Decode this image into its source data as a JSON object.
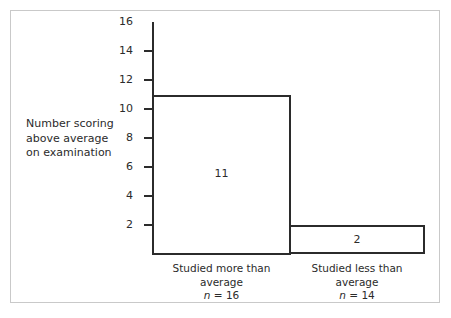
{
  "chart_data": {
    "type": "bar",
    "title": "",
    "xlabel": "",
    "ylabel": "Number scoring above average on examination",
    "ylim": [
      0,
      16
    ],
    "ytick_values": [
      2,
      4,
      6,
      8,
      10,
      12,
      14,
      16
    ],
    "ytick_labels": [
      "2",
      "4",
      "6",
      "8",
      "10",
      "12",
      "14",
      "16"
    ],
    "grid": false,
    "legend": "none",
    "categories": [
      "Studied more than average",
      "Studied less than average"
    ],
    "values": [
      11,
      2
    ],
    "data_labels": [
      "11",
      "2"
    ],
    "group_sizes": [
      "n = 16",
      "n = 14"
    ],
    "bar_style": "outlined-unfilled"
  },
  "axis": {
    "y_label_lines": [
      "Number scoring",
      "above average",
      "on examination"
    ],
    "ticks": [
      {
        "label": "16",
        "value": 16,
        "has_mark": false
      },
      {
        "label": "14",
        "value": 14,
        "has_mark": true
      },
      {
        "label": "12",
        "value": 12,
        "has_mark": true
      },
      {
        "label": "10",
        "value": 10,
        "has_mark": true
      },
      {
        "label": "8",
        "value": 8,
        "has_mark": true
      },
      {
        "label": "6",
        "value": 6,
        "has_mark": true
      },
      {
        "label": "4",
        "value": 4,
        "has_mark": true
      },
      {
        "label": "2",
        "value": 2,
        "has_mark": true
      }
    ]
  },
  "bars": [
    {
      "value_label": "11",
      "category_line1": "Studied more than",
      "category_line2": "average",
      "n_symbol": "n",
      "n_value": " = 16"
    },
    {
      "value_label": "2",
      "category_line1": "Studied less than",
      "category_line2": "average",
      "n_symbol": "n",
      "n_value": " = 14"
    }
  ],
  "colors": {
    "ink": "#2b2b2b",
    "frame": "#c9c9c9",
    "background": "#ffffff"
  }
}
